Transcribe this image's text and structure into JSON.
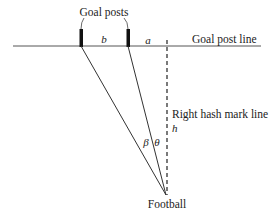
{
  "diagram": {
    "title_label": "Goal posts",
    "goal_post_line_label": "Goal post line",
    "hash_line_label": "Right hash mark line",
    "football_label": "Football",
    "variables": {
      "b": "b",
      "a": "a",
      "h": "h",
      "beta": "β",
      "theta": "θ"
    },
    "colors": {
      "line": "#333333",
      "post": "#111111",
      "background": "#ffffff"
    }
  }
}
